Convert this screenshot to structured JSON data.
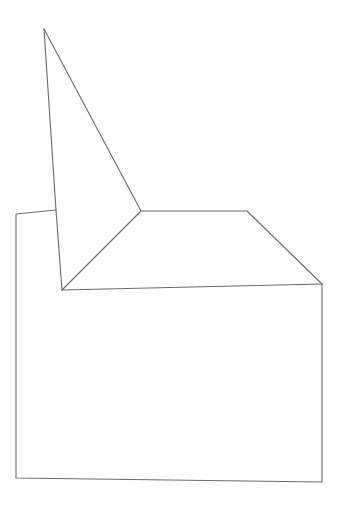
{
  "diagram": {
    "type": "line-drawing",
    "width": 344,
    "height": 505,
    "background": "#ffffff",
    "stroke_color": "#6a6a6a",
    "stroke_width": 1.1,
    "shapes": [
      {
        "name": "tall-triangle",
        "points": [
          [
            44,
            29
          ],
          [
            141,
            211
          ],
          [
            62,
            290
          ]
        ],
        "closed": false
      },
      {
        "name": "tall-left-edge",
        "points": [
          [
            44,
            29
          ],
          [
            56,
            210
          ],
          [
            62,
            290
          ]
        ],
        "closed": false
      },
      {
        "name": "top-trapezoid",
        "points": [
          [
            141,
            211
          ],
          [
            247,
            211
          ],
          [
            322,
            284
          ]
        ],
        "closed": false
      },
      {
        "name": "inner-baseline",
        "points": [
          [
            62,
            290
          ],
          [
            322,
            284
          ]
        ],
        "closed": false
      },
      {
        "name": "base-box",
        "points": [
          [
            56,
            210
          ],
          [
            16,
            214
          ],
          [
            16,
            478
          ],
          [
            322,
            482
          ],
          [
            322,
            284
          ]
        ],
        "closed": false
      }
    ]
  }
}
